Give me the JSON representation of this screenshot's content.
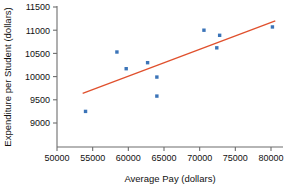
{
  "chart_data": {
    "type": "scatter",
    "title": "",
    "xlabel": "Average Pay (dollars)",
    "ylabel": "Expenditure per Student (dollars)",
    "xlim": [
      48500,
      82000
    ],
    "ylim": [
      9000,
      11500
    ],
    "xticks": [
      50000,
      55000,
      60000,
      65000,
      70000,
      75000,
      80000
    ],
    "yticks": [
      9000,
      9500,
      10000,
      10500,
      11000,
      11500
    ],
    "xtick_labels": [
      "50000",
      "55000",
      "60000",
      "65000",
      "70000",
      "75000",
      "80000"
    ],
    "ytick_labels": [
      "9000",
      "9500",
      "10000",
      "10500",
      "11000",
      "11500"
    ],
    "grid": false,
    "legend": false,
    "point_color": "#3b74b8",
    "line_color": "#e0502d",
    "axis_color": "#6d6d6d",
    "points": [
      {
        "x": 54000,
        "y": 9250
      },
      {
        "x": 58400,
        "y": 10530
      },
      {
        "x": 59700,
        "y": 10170
      },
      {
        "x": 62700,
        "y": 10300
      },
      {
        "x": 64000,
        "y": 9990
      },
      {
        "x": 64000,
        "y": 9580
      },
      {
        "x": 70600,
        "y": 11000
      },
      {
        "x": 72400,
        "y": 10620
      },
      {
        "x": 72800,
        "y": 10890
      },
      {
        "x": 80200,
        "y": 11070
      }
    ],
    "trend_line": {
      "label": "least-squares regression line",
      "x_start": 53600,
      "y_start": 9640,
      "x_end": 80600,
      "y_end": 11200
    }
  }
}
